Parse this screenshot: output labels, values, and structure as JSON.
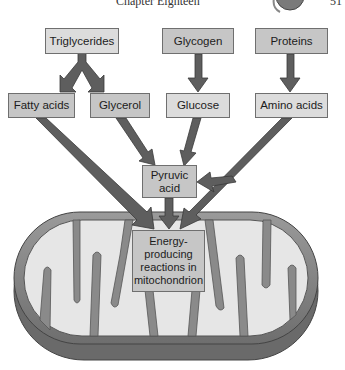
{
  "header": {
    "title": "Chapter Eighteen",
    "page_number": "51",
    "icon": "page-decoration-icon"
  },
  "diagram": {
    "sources": [
      {
        "id": "triglycerides",
        "label": "Triglycerides"
      },
      {
        "id": "glycogen",
        "label": "Glycogen"
      },
      {
        "id": "proteins",
        "label": "Proteins"
      }
    ],
    "intermediates": [
      {
        "id": "fatty_acids",
        "label": "Fatty acids"
      },
      {
        "id": "glycerol",
        "label": "Glycerol"
      },
      {
        "id": "glucose",
        "label": "Glucose"
      },
      {
        "id": "amino_acids",
        "label": "Amino acids"
      }
    ],
    "pyruvic": {
      "line1": "Pyruvic",
      "line2": "acid"
    },
    "energy": {
      "line1": "Energy-",
      "line2": "producing",
      "line3": "reactions in",
      "line4": "mitochondrion"
    },
    "edges": [
      [
        "Triglycerides",
        "Fatty acids"
      ],
      [
        "Triglycerides",
        "Glycerol"
      ],
      [
        "Glycogen",
        "Glucose"
      ],
      [
        "Proteins",
        "Amino acids"
      ],
      [
        "Fatty acids",
        "Energy-producing reactions in mitochondrion"
      ],
      [
        "Glycerol",
        "Pyruvic acid"
      ],
      [
        "Glucose",
        "Pyruvic acid"
      ],
      [
        "Amino acids",
        "Pyruvic acid"
      ],
      [
        "Amino acids",
        "Energy-producing reactions in mitochondrion"
      ],
      [
        "Pyruvic acid",
        "Energy-producing reactions in mitochondrion"
      ]
    ],
    "colors": {
      "arrow": "#5e5e5e",
      "arrow_outline": "#3a3a3a",
      "box_light": "#dcdcdc",
      "box_mid": "#c6c6c6",
      "membrane": "#8a8a8a",
      "matrix": "#e6e6e6"
    }
  }
}
